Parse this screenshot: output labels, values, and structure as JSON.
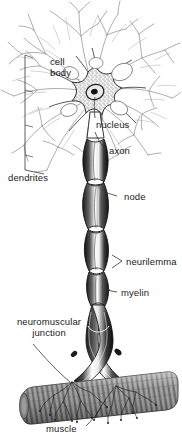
{
  "figure": {
    "style": "black-and-white pen-and-ink biological illustration",
    "background_color": "#ffffff",
    "ink_color": "#1b1b1b",
    "muscle_color": "#8a8a8a"
  },
  "labels": [
    {
      "id": "cell-body",
      "text": "cell\nbody",
      "line1": "cell",
      "line2": "body",
      "x": 50,
      "y": 57
    },
    {
      "id": "nucleus",
      "text": "nucleus",
      "line1": "nucleus",
      "line2": "",
      "x": 96,
      "y": 120
    },
    {
      "id": "axon",
      "text": "axon",
      "line1": "axon",
      "line2": "",
      "x": 108,
      "y": 145
    },
    {
      "id": "dendrites",
      "text": "dendrites",
      "line1": "dendrites",
      "line2": "",
      "x": 8,
      "y": 172
    },
    {
      "id": "node",
      "text": "node",
      "line1": "node",
      "line2": "",
      "x": 119,
      "y": 192
    },
    {
      "id": "neurilemma",
      "text": "neurilemma",
      "line1": "neurilemma",
      "line2": "",
      "x": 124,
      "y": 257
    },
    {
      "id": "myelin",
      "text": "myelin",
      "line1": "myelin",
      "line2": "",
      "x": 119,
      "y": 288
    },
    {
      "id": "neuromuscular-junction",
      "text": "neuromuscular\njunction",
      "line1": "neuromuscular",
      "line2": "junction",
      "x": 9,
      "y": 317
    },
    {
      "id": "muscle",
      "text": "muscle",
      "line1": "muscle",
      "line2": "",
      "x": 46,
      "y": 423
    }
  ],
  "structures": {
    "soma": "stippled star-shaped cell body",
    "nucleus": "dark oval nucleus with nucleolus",
    "dendrites": "branching fine dendritic arbor",
    "axon": "long myelinated axon descending",
    "nodes": "constrictions between myelin segments (nodes of Ranvier)",
    "neurilemma": "outer sheath membrane of the axon",
    "myelin": "segmented fatty insulating sheath",
    "terminals": "two axon terminal branches ending on the muscle",
    "muscle": "striated skeletal muscle fiber"
  }
}
